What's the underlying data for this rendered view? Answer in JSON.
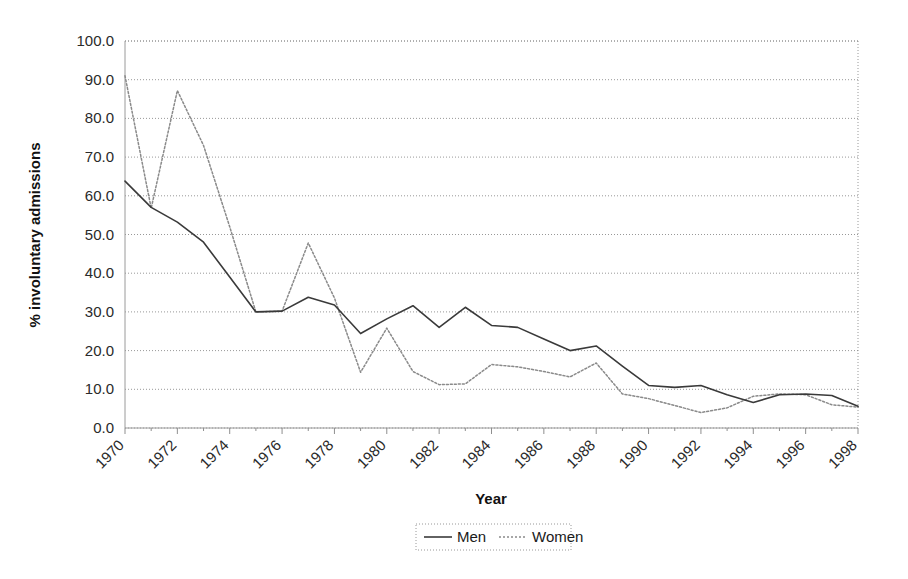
{
  "chart_data": {
    "type": "line",
    "title": "",
    "xlabel": "Year",
    "ylabel": "% involuntary admissions",
    "xlim": [
      1970,
      1998
    ],
    "ylim": [
      0.0,
      100.0
    ],
    "grid": true,
    "legend_position": "bottom",
    "x": [
      1970,
      1971,
      1972,
      1973,
      1974,
      1975,
      1976,
      1977,
      1978,
      1979,
      1980,
      1981,
      1982,
      1983,
      1984,
      1985,
      1986,
      1987,
      1988,
      1989,
      1990,
      1991,
      1992,
      1993,
      1994,
      1995,
      1996,
      1997,
      1998
    ],
    "xtick_labels": [
      "1970",
      "1972",
      "1974",
      "1976",
      "1978",
      "1980",
      "1982",
      "1984",
      "1986",
      "1988",
      "1990",
      "1992",
      "1994",
      "1996",
      "1998"
    ],
    "ytick_labels": [
      "0.0",
      "10.0",
      "20.0",
      "30.0",
      "40.0",
      "50.0",
      "60.0",
      "70.0",
      "80.0",
      "90.0",
      "100.0"
    ],
    "ytick_values": [
      0,
      10,
      20,
      30,
      40,
      50,
      60,
      70,
      80,
      90,
      100
    ],
    "series": [
      {
        "name": "Men",
        "style": "solid",
        "color": "#3a3a3a",
        "values": [
          63.8,
          57.0,
          53.2,
          48.0,
          39.0,
          30.0,
          30.2,
          33.8,
          31.8,
          24.4,
          28.2,
          31.6,
          26.0,
          31.2,
          26.5,
          26.0,
          23.0,
          20.0,
          21.2,
          16.0,
          11.0,
          10.5,
          11.0,
          8.6,
          6.6,
          8.6,
          8.8,
          8.4,
          5.6
        ]
      },
      {
        "name": "Women",
        "style": "dotted",
        "color": "#8a8a8a",
        "values": [
          91.0,
          56.8,
          87.2,
          73.0,
          52.0,
          30.0,
          30.2,
          47.8,
          33.6,
          14.4,
          25.8,
          14.6,
          11.2,
          11.4,
          16.4,
          15.8,
          14.6,
          13.2,
          16.8,
          8.8,
          7.6,
          5.8,
          4.0,
          5.2,
          8.2,
          8.8,
          8.6,
          6.0,
          5.4
        ]
      }
    ]
  },
  "legend": {
    "entries": [
      {
        "label": "Men"
      },
      {
        "label": "Women"
      }
    ]
  },
  "axes": {
    "x_title": "Year",
    "y_title": "% involuntary admissions"
  }
}
